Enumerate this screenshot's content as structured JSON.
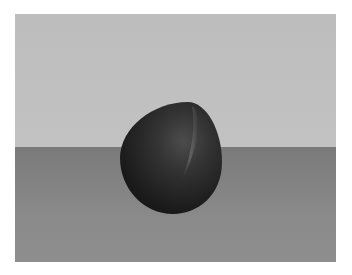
{
  "scene": {
    "description": "3D render of a dark egg-shaped object resting on a gray surface in front of a light gray backdrop",
    "colors": {
      "border": "#ffffff",
      "backdrop": "#c0c0c0",
      "floor": "#858585",
      "object": "#2a2a2a",
      "highlight": "#5a5a5a"
    }
  }
}
